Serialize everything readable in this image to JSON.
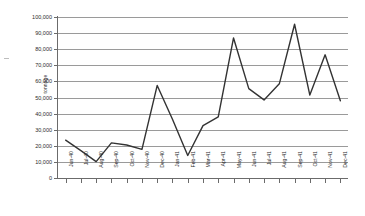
{
  "chart_data": {
    "type": "line",
    "title": "",
    "xlabel": "",
    "ylabel": "tonnage",
    "ylim": [
      0,
      100000
    ],
    "yticks": [
      0,
      10000,
      20000,
      30000,
      40000,
      50000,
      60000,
      70000,
      80000,
      90000,
      100000
    ],
    "ytick_labels": [
      "0",
      "10,000",
      "20,000",
      "30,000",
      "40,000",
      "50,000",
      "60,000",
      "70,000",
      "80,000",
      "90,000",
      "100,000"
    ],
    "grid": true,
    "legend": false,
    "legend_position": "none",
    "line_color": "#333333",
    "categories": [
      "Jun-40",
      "Jul-40",
      "Aug-40",
      "Sep-40",
      "Oct-40",
      "Nov-40",
      "Dec-40",
      "Jan-41",
      "Feb-41",
      "Mar-41",
      "Apr-41",
      "May-41",
      "Jun-41",
      "Jul-41",
      "Aug-41",
      "Sep-41",
      "Oct-41",
      "Nov-41",
      "Dec-41"
    ],
    "values": [
      23500,
      17000,
      10200,
      21800,
      20500,
      17800,
      57500,
      36500,
      14000,
      32500,
      38000,
      87000,
      55500,
      48500,
      58500,
      95500,
      51500,
      76500,
      48000
    ]
  }
}
